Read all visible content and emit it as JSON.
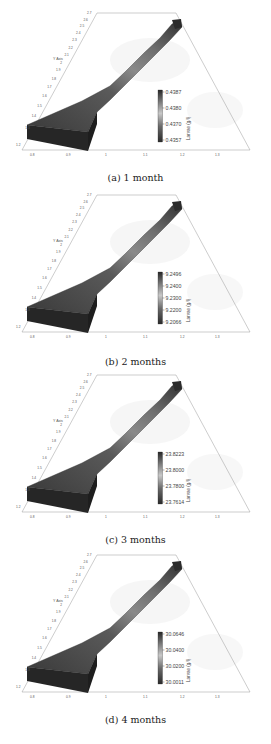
{
  "figures": [
    {
      "id": "a",
      "caption": "(a) 1 month",
      "colorbar": {
        "label": "Larvae (g/l)",
        "max": "0.4387",
        "ticks": [
          "0.4380",
          "0.4370"
        ],
        "min": "0.4357"
      }
    },
    {
      "id": "b",
      "caption": "(b) 2 months",
      "colorbar": {
        "label": "Larvae (g/l)",
        "max": "9.2496",
        "ticks": [
          "9.2400",
          "9.2300",
          "9.2200"
        ],
        "min": "9.2066"
      }
    },
    {
      "id": "c",
      "caption": "(c) 3 months",
      "colorbar": {
        "label": "Larvae (g/l)",
        "max": "23.8223",
        "ticks": [
          "23.8000",
          "23.7800"
        ],
        "min": "23.7614"
      }
    },
    {
      "id": "d",
      "caption": "(d) 4 months",
      "colorbar": {
        "label": "Larvae (g/l)",
        "max": "30.0646",
        "ticks": [
          "30.0400",
          "30.0200"
        ],
        "min": "30.0011"
      }
    }
  ],
  "axes": {
    "x_label": "X Axis",
    "y_label": "Y Axis",
    "x_ticks": [
      "0.8",
      "0.9",
      "1",
      "1.1",
      "1.2",
      "1.3"
    ],
    "y_ticks": [
      "1.2",
      "1.3",
      "1.4",
      "1.5",
      "1.6",
      "1.7",
      "1.8",
      "1.9",
      "2",
      "2.1",
      "2.2",
      "2.3",
      "2.4",
      "2.5",
      "2.6",
      "2.7"
    ]
  },
  "chart_data": [
    {
      "type": "heatmap",
      "title": "(a) 1 month",
      "xlabel": "X Axis",
      "ylabel": "Y Axis",
      "xlim": [
        0.8,
        1.3
      ],
      "ylim": [
        1.2,
        2.7
      ],
      "colorbar": {
        "label": "Larvae (g/l)",
        "min": 0.4357,
        "max": 0.4387,
        "ticks": [
          0.4357,
          0.437,
          0.438,
          0.4387
        ]
      },
      "grid": false
    },
    {
      "type": "heatmap",
      "title": "(b) 2 months",
      "xlabel": "X Axis",
      "ylabel": "Y Axis",
      "xlim": [
        0.8,
        1.3
      ],
      "ylim": [
        1.2,
        2.7
      ],
      "colorbar": {
        "label": "Larvae (g/l)",
        "min": 9.2066,
        "max": 9.2496,
        "ticks": [
          9.2066,
          9.22,
          9.23,
          9.24,
          9.2496
        ]
      },
      "grid": false
    },
    {
      "type": "heatmap",
      "title": "(c) 3 months",
      "xlabel": "X Axis",
      "ylabel": "Y Axis",
      "xlim": [
        0.8,
        1.3
      ],
      "ylim": [
        1.2,
        2.7
      ],
      "colorbar": {
        "label": "Larvae (g/l)",
        "min": 23.7614,
        "max": 23.8223,
        "ticks": [
          23.7614,
          23.78,
          23.8,
          23.8223
        ]
      },
      "grid": false
    },
    {
      "type": "heatmap",
      "title": "(d) 4 months",
      "xlabel": "X Axis",
      "ylabel": "Y Axis",
      "xlim": [
        0.8,
        1.3
      ],
      "ylim": [
        1.2,
        2.7
      ],
      "colorbar": {
        "label": "Larvae (g/l)",
        "min": 30.0011,
        "max": 30.0646,
        "ticks": [
          30.0011,
          30.02,
          30.04,
          30.0646
        ]
      },
      "grid": false
    }
  ]
}
